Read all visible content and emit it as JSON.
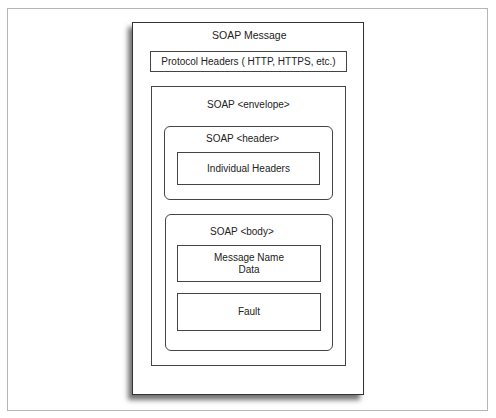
{
  "diagram": {
    "title": "SOAP Message",
    "protocol_headers": "Protocol Headers ( HTTP, HTTPS, etc.)",
    "envelope": {
      "label": "SOAP <envelope>",
      "header": {
        "label": "SOAP <header>",
        "content": "Individual Headers"
      },
      "body": {
        "label": "SOAP <body>",
        "message_line1": "Message Name",
        "message_line2": "Data",
        "fault": "Fault"
      }
    }
  }
}
